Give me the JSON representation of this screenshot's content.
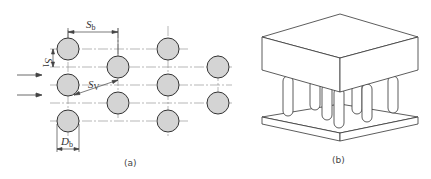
{
  "figure_a": {
    "caption": "(a)",
    "labels": {
      "sb": {
        "main": "S",
        "sub": "b"
      },
      "s1": {
        "main": "S",
        "sub": "1"
      },
      "sv": {
        "main": "S",
        "sub": "V"
      },
      "db": {
        "main": "D",
        "sub": "b"
      }
    },
    "flow_arrows": 2,
    "columns": [
      {
        "x": 68,
        "rows_y": [
          49,
          85,
          121
        ]
      },
      {
        "x": 118,
        "rows_y": [
          67,
          103
        ]
      },
      {
        "x": 168,
        "rows_y": [
          49,
          85,
          121
        ]
      },
      {
        "x": 218,
        "rows_y": [
          67,
          103
        ]
      }
    ],
    "circle_fill": "#d4d4d4"
  },
  "figure_b": {
    "caption": "(b)"
  }
}
